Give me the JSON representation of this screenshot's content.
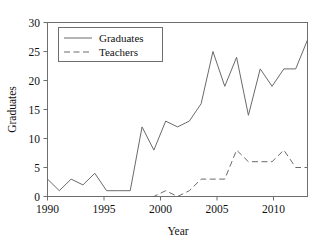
{
  "chart_data": {
    "type": "line",
    "title": "",
    "xlabel": "Year",
    "ylabel": "Graduates",
    "xlim": [
      1990,
      2012
    ],
    "ylim": [
      0,
      30
    ],
    "grid": false,
    "legend_position": "upper-left",
    "x": [
      1990,
      1991,
      1992,
      1993,
      1994,
      1995,
      1996,
      1997,
      1998,
      1999,
      2000,
      2001,
      2002,
      2003,
      2004,
      2005,
      2006,
      2007,
      2008,
      2009,
      2010,
      2011,
      2012
    ],
    "series": [
      {
        "name": "Graduates",
        "style": "solid",
        "color": "#6a6a6a",
        "values": [
          3,
          1,
          3,
          2,
          4,
          1,
          1,
          1,
          12,
          8,
          13,
          12,
          13,
          16,
          25,
          19,
          24,
          14,
          22,
          19,
          22,
          22,
          27
        ]
      },
      {
        "name": "Teachers",
        "style": "dashed",
        "color": "#6a6a6a",
        "values": [
          0,
          0,
          0,
          0,
          0,
          0,
          0,
          0,
          0,
          0,
          1,
          0,
          1,
          3,
          3,
          3,
          8,
          6,
          6,
          6,
          8,
          5,
          5
        ]
      }
    ],
    "xticks": [
      1990,
      1995,
      2000,
      2005,
      2010
    ],
    "xtick_labels": [
      "1990",
      "1995",
      "2000",
      "2005",
      "2010"
    ],
    "yticks": [
      0,
      5,
      10,
      15,
      20,
      25,
      30
    ],
    "ytick_labels": [
      "0",
      "5",
      "10",
      "15",
      "20",
      "25",
      "30"
    ]
  },
  "axes": {
    "x_title": "Year",
    "y_title": "Graduates"
  },
  "legend": {
    "entries": [
      {
        "label": "Graduates"
      },
      {
        "label": "Teachers"
      }
    ]
  }
}
